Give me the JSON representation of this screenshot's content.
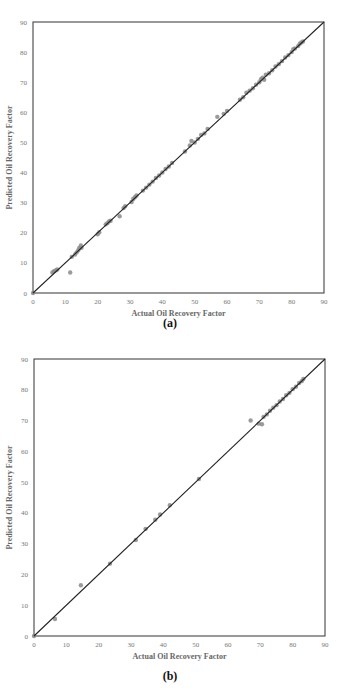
{
  "chart_data": [
    {
      "type": "scatter",
      "panel_label": "(a)",
      "title": "",
      "xlabel": "Actual Oil Recovery Factor",
      "ylabel": "Predicted Oil Recovery Factor",
      "xlim": [
        0,
        90
      ],
      "ylim": [
        0,
        90
      ],
      "xticks": [
        0,
        10,
        20,
        30,
        40,
        50,
        60,
        70,
        80,
        90
      ],
      "yticks": [
        0,
        10,
        20,
        30,
        40,
        50,
        60,
        70,
        80,
        90
      ],
      "grid": false,
      "legend": null,
      "reference_line": {
        "type": "y=x",
        "from": [
          0,
          0
        ],
        "to": [
          90,
          90
        ],
        "color": "#222222"
      },
      "marker_color": "#8a8a8a",
      "series": [
        {
          "name": "Predicted vs Actual",
          "points": [
            [
              0,
              0
            ],
            [
              6,
              6.8
            ],
            [
              6.5,
              7.2
            ],
            [
              7,
              7.5
            ],
            [
              7.5,
              7.8
            ],
            [
              11.5,
              6.8
            ],
            [
              12,
              12
            ],
            [
              13,
              12.8
            ],
            [
              13.5,
              13.5
            ],
            [
              14,
              14.2
            ],
            [
              14.3,
              15
            ],
            [
              14.8,
              15.8
            ],
            [
              15,
              15
            ],
            [
              20,
              19.5
            ],
            [
              20.5,
              20.2
            ],
            [
              22.5,
              22.8
            ],
            [
              23,
              23.2
            ],
            [
              23.5,
              23.8
            ],
            [
              24,
              24
            ],
            [
              26.8,
              25.5
            ],
            [
              28,
              28.2
            ],
            [
              28.5,
              28.8
            ],
            [
              30.5,
              30.2
            ],
            [
              31,
              31.2
            ],
            [
              31.5,
              31.8
            ],
            [
              32,
              32.4
            ],
            [
              34,
              34
            ],
            [
              35,
              35
            ],
            [
              36,
              36
            ],
            [
              37,
              37
            ],
            [
              38,
              38.2
            ],
            [
              39,
              39
            ],
            [
              40,
              40
            ],
            [
              41,
              41.2
            ],
            [
              42,
              42
            ],
            [
              43,
              43.2
            ],
            [
              47,
              47
            ],
            [
              48.5,
              49
            ],
            [
              49,
              50.5
            ],
            [
              50,
              50
            ],
            [
              51,
              51.2
            ],
            [
              52,
              52.5
            ],
            [
              53,
              53
            ],
            [
              54,
              54.5
            ],
            [
              57,
              58.5
            ],
            [
              59,
              59.5
            ],
            [
              60,
              60.5
            ],
            [
              64,
              64.2
            ],
            [
              65,
              65
            ],
            [
              66,
              66.5
            ],
            [
              67,
              67.2
            ],
            [
              68,
              68
            ],
            [
              69,
              69.2
            ],
            [
              70,
              70
            ],
            [
              70.5,
              71
            ],
            [
              71,
              71.5
            ],
            [
              71.5,
              70.8
            ],
            [
              72,
              72.5
            ],
            [
              73,
              73
            ],
            [
              74,
              74
            ],
            [
              75,
              75.2
            ],
            [
              76,
              76
            ],
            [
              77,
              77
            ],
            [
              78,
              78.2
            ],
            [
              79,
              79
            ],
            [
              80,
              80
            ],
            [
              80.5,
              81
            ],
            [
              81,
              81.2
            ],
            [
              82,
              82
            ],
            [
              82.5,
              82.8
            ],
            [
              83,
              83.2
            ],
            [
              83.5,
              83.5
            ]
          ]
        }
      ]
    },
    {
      "type": "scatter",
      "panel_label": "(b)",
      "title": "",
      "xlabel": "Actual Oil Recovery Factor",
      "ylabel": "Predicted Oil Recovery Factor",
      "xlim": [
        0,
        90
      ],
      "ylim": [
        0,
        90
      ],
      "xticks": [
        0,
        10,
        20,
        30,
        40,
        50,
        60,
        70,
        80,
        90
      ],
      "yticks": [
        0,
        10,
        20,
        30,
        40,
        50,
        60,
        70,
        80,
        90
      ],
      "grid": false,
      "legend": null,
      "reference_line": {
        "type": "y=x",
        "from": [
          0,
          0
        ],
        "to": [
          90,
          90
        ],
        "color": "#222222"
      },
      "marker_color": "#8a8a8a",
      "series": [
        {
          "name": "Predicted vs Actual",
          "points": [
            [
              0,
              0
            ],
            [
              6.5,
              5.5
            ],
            [
              14.5,
              16.5
            ],
            [
              23.5,
              23.5
            ],
            [
              31.5,
              31.2
            ],
            [
              34.5,
              34.8
            ],
            [
              37.5,
              37.8
            ],
            [
              39,
              39.5
            ],
            [
              42,
              42.5
            ],
            [
              51,
              51
            ],
            [
              67,
              70
            ],
            [
              69.5,
              69
            ],
            [
              70.5,
              68.8
            ],
            [
              71,
              71.2
            ],
            [
              72,
              72
            ],
            [
              73,
              73.2
            ],
            [
              74,
              74.2
            ],
            [
              75,
              75
            ],
            [
              76,
              76.2
            ],
            [
              77,
              77
            ],
            [
              78,
              78.2
            ],
            [
              79,
              79
            ],
            [
              80,
              80.2
            ],
            [
              81,
              81
            ],
            [
              82,
              82.2
            ],
            [
              82.8,
              82.8
            ],
            [
              83.3,
              83.5
            ]
          ]
        }
      ]
    }
  ]
}
